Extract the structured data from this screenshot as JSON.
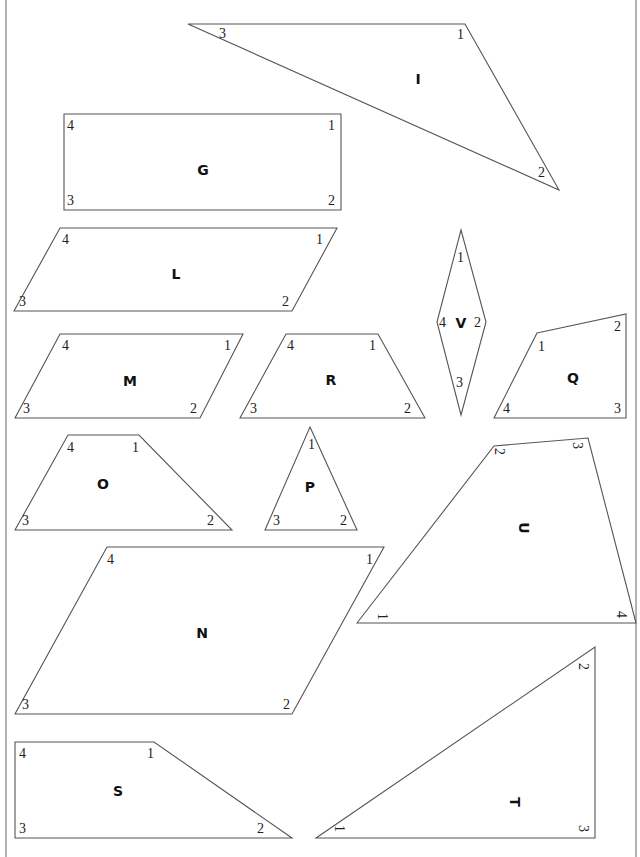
{
  "page": {
    "header_text": "",
    "border_color": "#666666",
    "stroke_color": "#555555"
  },
  "shapes": [
    {
      "id": "I",
      "label": "I",
      "points": [
        [
          188,
          24
        ],
        [
          465,
          24
        ],
        [
          559,
          190
        ]
      ],
      "label_pos": [
        418,
        84
      ],
      "vertices": [
        {
          "n": "3",
          "x": 219,
          "y": 38
        },
        {
          "n": "1",
          "x": 457,
          "y": 39
        },
        {
          "n": "2",
          "x": 538,
          "y": 177
        }
      ]
    },
    {
      "id": "G",
      "label": "G",
      "points": [
        [
          64,
          114
        ],
        [
          341,
          114
        ],
        [
          341,
          210
        ],
        [
          64,
          210
        ]
      ],
      "label_pos": [
        203,
        175
      ],
      "vertices": [
        {
          "n": "4",
          "x": 67,
          "y": 130
        },
        {
          "n": "1",
          "x": 328,
          "y": 130
        },
        {
          "n": "3",
          "x": 67,
          "y": 205
        },
        {
          "n": "2",
          "x": 328,
          "y": 205
        }
      ]
    },
    {
      "id": "L",
      "label": "L",
      "points": [
        [
          60,
          228
        ],
        [
          337,
          228
        ],
        [
          292,
          311
        ],
        [
          14,
          311
        ]
      ],
      "label_pos": [
        176,
        279
      ],
      "vertices": [
        {
          "n": "4",
          "x": 62,
          "y": 244
        },
        {
          "n": "1",
          "x": 316,
          "y": 244
        },
        {
          "n": "3",
          "x": 19,
          "y": 306
        },
        {
          "n": "2",
          "x": 282,
          "y": 306
        }
      ]
    },
    {
      "id": "M",
      "label": "M",
      "points": [
        [
          60,
          334
        ],
        [
          243,
          334
        ],
        [
          200,
          418
        ],
        [
          15,
          418
        ]
      ],
      "label_pos": [
        130,
        386
      ],
      "vertices": [
        {
          "n": "4",
          "x": 62,
          "y": 350
        },
        {
          "n": "1",
          "x": 224,
          "y": 350
        },
        {
          "n": "3",
          "x": 23,
          "y": 413
        },
        {
          "n": "2",
          "x": 190,
          "y": 413
        }
      ]
    },
    {
      "id": "R",
      "label": "R",
      "points": [
        [
          286,
          334
        ],
        [
          378,
          334
        ],
        [
          425,
          418
        ],
        [
          240,
          418
        ]
      ],
      "label_pos": [
        331,
        385
      ],
      "vertices": [
        {
          "n": "4",
          "x": 287,
          "y": 350
        },
        {
          "n": "1",
          "x": 369,
          "y": 350
        },
        {
          "n": "3",
          "x": 250,
          "y": 413
        },
        {
          "n": "2",
          "x": 404,
          "y": 413
        }
      ]
    },
    {
      "id": "V",
      "label": "V",
      "points": [
        [
          461,
          230
        ],
        [
          486,
          322
        ],
        [
          461,
          415
        ],
        [
          437,
          322
        ]
      ],
      "label_pos": [
        461,
        328
      ],
      "vertices": [
        {
          "n": "1",
          "x": 457,
          "y": 262
        },
        {
          "n": "2",
          "x": 474,
          "y": 327
        },
        {
          "n": "4",
          "x": 439,
          "y": 327
        },
        {
          "n": "3",
          "x": 456,
          "y": 387
        }
      ]
    },
    {
      "id": "Q",
      "label": "Q",
      "points": [
        [
          537,
          333
        ],
        [
          626,
          314
        ],
        [
          626,
          418
        ],
        [
          494,
          418
        ]
      ],
      "label_pos": [
        573,
        383
      ],
      "vertices": [
        {
          "n": "1",
          "x": 538,
          "y": 351
        },
        {
          "n": "2",
          "x": 614,
          "y": 331
        },
        {
          "n": "4",
          "x": 503,
          "y": 413
        },
        {
          "n": "3",
          "x": 614,
          "y": 413
        }
      ]
    },
    {
      "id": "O",
      "label": "O",
      "points": [
        [
          68,
          435
        ],
        [
          139,
          435
        ],
        [
          232,
          530
        ],
        [
          15,
          530
        ]
      ],
      "label_pos": [
        103,
        489
      ],
      "vertices": [
        {
          "n": "4",
          "x": 67,
          "y": 452
        },
        {
          "n": "1",
          "x": 132,
          "y": 452
        },
        {
          "n": "3",
          "x": 22,
          "y": 525
        },
        {
          "n": "2",
          "x": 207,
          "y": 525
        }
      ]
    },
    {
      "id": "P",
      "label": "P",
      "points": [
        [
          310,
          427
        ],
        [
          357,
          530
        ],
        [
          265,
          530
        ]
      ],
      "label_pos": [
        310,
        492
      ],
      "vertices": [
        {
          "n": "1",
          "x": 308,
          "y": 449
        },
        {
          "n": "3",
          "x": 273,
          "y": 525
        },
        {
          "n": "2",
          "x": 340,
          "y": 525
        }
      ]
    },
    {
      "id": "U",
      "label": "U",
      "points": [
        [
          357,
          623
        ],
        [
          494,
          446
        ],
        [
          588,
          438
        ],
        [
          636,
          623
        ]
      ],
      "label_pos": [
        524,
        533
      ],
      "rotated": true,
      "vertices": [
        {
          "n": "1",
          "x": 383,
          "y": 618
        },
        {
          "n": "2",
          "x": 500,
          "y": 453
        },
        {
          "n": "3",
          "x": 578,
          "y": 447
        },
        {
          "n": "4",
          "x": 622,
          "y": 616
        }
      ]
    },
    {
      "id": "N",
      "label": "N",
      "points": [
        [
          107,
          547
        ],
        [
          384,
          547
        ],
        [
          292,
          714
        ],
        [
          15,
          714
        ]
      ],
      "label_pos": [
        202,
        638
      ],
      "vertices": [
        {
          "n": "4",
          "x": 107,
          "y": 564
        },
        {
          "n": "1",
          "x": 366,
          "y": 564
        },
        {
          "n": "3",
          "x": 22,
          "y": 709
        },
        {
          "n": "2",
          "x": 283,
          "y": 709
        }
      ]
    },
    {
      "id": "S",
      "label": "S",
      "points": [
        [
          15,
          742
        ],
        [
          154,
          742
        ],
        [
          292,
          838
        ],
        [
          15,
          838
        ]
      ],
      "label_pos": [
        118,
        796
      ],
      "vertices": [
        {
          "n": "4",
          "x": 19,
          "y": 758
        },
        {
          "n": "1",
          "x": 147,
          "y": 758
        },
        {
          "n": "3",
          "x": 19,
          "y": 833
        },
        {
          "n": "2",
          "x": 257,
          "y": 833
        }
      ]
    },
    {
      "id": "T",
      "label": "T",
      "points": [
        [
          316,
          838
        ],
        [
          595,
          647
        ],
        [
          595,
          838
        ]
      ],
      "label_pos": [
        515,
        807
      ],
      "rotated": true,
      "vertices": [
        {
          "n": "1",
          "x": 340,
          "y": 830
        },
        {
          "n": "2",
          "x": 584,
          "y": 668
        },
        {
          "n": "3",
          "x": 584,
          "y": 830
        }
      ]
    }
  ]
}
